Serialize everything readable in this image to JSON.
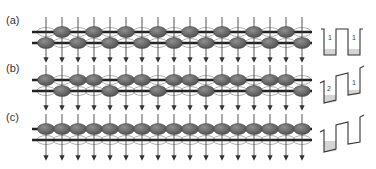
{
  "figure": {
    "panels": [
      {
        "label": "(a)",
        "pattern": "checkerboard",
        "occupancy": [
          "B",
          "T",
          "B",
          "T",
          "B",
          "T",
          "B",
          "T",
          "B",
          "T",
          "B",
          "T",
          "B",
          "T",
          "B",
          "T",
          "B"
        ],
        "y_top_line": 32,
        "y_bottom_line": 43,
        "arrow_top": 17,
        "arrow_tip": 60,
        "well": {
          "type": "equal-double",
          "labels": [
            "1",
            "1"
          ]
        }
      },
      {
        "label": "(b)",
        "pattern": "period-3",
        "occupancy": [
          "T",
          "B",
          "T",
          "T",
          "B",
          "T",
          "T",
          "B",
          "T",
          "T",
          "B",
          "T",
          "T",
          "B",
          "T",
          "T",
          "B"
        ],
        "y_top_line": 80,
        "y_bottom_line": 91,
        "arrow_top": 65,
        "arrow_tip": 108,
        "well": {
          "type": "tilted-double",
          "labels": [
            "2",
            "1"
          ]
        }
      },
      {
        "label": "(c)",
        "pattern": "all-top",
        "occupancy": [
          "T",
          "T",
          "T",
          "T",
          "T",
          "T",
          "T",
          "T",
          "T",
          "T",
          "T",
          "T",
          "T",
          "T",
          "T",
          "T",
          "T"
        ],
        "y_top_line": 129,
        "y_bottom_line": 140,
        "arrow_top": 114,
        "arrow_tip": 158,
        "well": {
          "type": "tilted-single-filled",
          "labels": []
        }
      }
    ],
    "columns": {
      "count": 17,
      "x_start": 46,
      "spacing": 16
    },
    "colors": {
      "filled_ellipse": "#6b6b6b",
      "empty_ellipse_stroke": "#9a9a9a",
      "lattice_line": "#222222",
      "arrow": "#444444",
      "well_fill": "#d4d4d4",
      "well_line": "#333333"
    }
  }
}
